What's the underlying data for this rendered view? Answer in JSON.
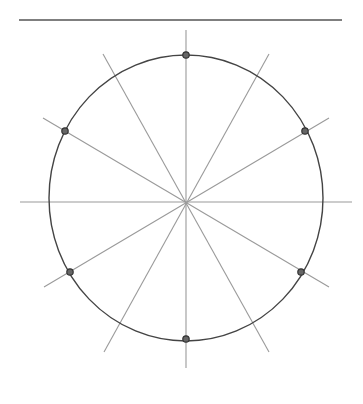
{
  "diagram": {
    "title": "",
    "canvas": {
      "width": 363,
      "height": 404,
      "background": "#ffffff"
    },
    "top_rule": {
      "x1": 19,
      "y1": 20,
      "x2": 342,
      "y2": 20,
      "color": "#555555"
    },
    "circle": {
      "cx": 186,
      "cy": 198,
      "rx": 137,
      "ry": 143,
      "color": "#444444"
    },
    "center": {
      "x": 186,
      "y": 202
    },
    "spokes_color": "#9a9a9a",
    "spokes": [
      {
        "x1": 186,
        "y1": 30,
        "x2": 186,
        "y2": 368
      },
      {
        "x1": 20,
        "y1": 202,
        "x2": 352,
        "y2": 202
      },
      {
        "x1": 103,
        "y1": 54,
        "x2": 269,
        "y2": 352
      },
      {
        "x1": 269,
        "y1": 54,
        "x2": 104,
        "y2": 352
      },
      {
        "x1": 43,
        "y1": 118,
        "x2": 329,
        "y2": 287
      },
      {
        "x1": 329,
        "y1": 118,
        "x2": 44,
        "y2": 287
      }
    ],
    "points_fill": "#666666",
    "points_stroke": "#333333",
    "points": [
      {
        "x": 186,
        "y": 55
      },
      {
        "x": 305,
        "y": 131
      },
      {
        "x": 301,
        "y": 272
      },
      {
        "x": 186,
        "y": 339
      },
      {
        "x": 70,
        "y": 272
      },
      {
        "x": 65,
        "y": 131
      }
    ]
  }
}
